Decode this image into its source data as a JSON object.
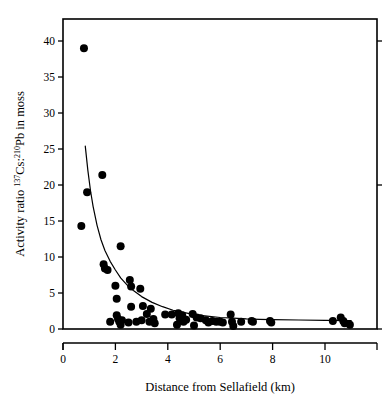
{
  "chart_data": {
    "type": "scatter",
    "title": "",
    "xlabel": "Distance from Sellafield (km)",
    "ylabel_parts": {
      "lead": "Activity ratio ",
      "sup1": "137",
      "mid1": "Cs:",
      "sup2": "210",
      "mid2": "Pb in moss"
    },
    "ylabel": "Activity ratio 137Cs:210Pb in moss",
    "xlim": [
      0,
      12.0
    ],
    "ylim": [
      -1.5,
      42.5
    ],
    "xticks": [
      0,
      2,
      4,
      6,
      8,
      10
    ],
    "xticklabels": [
      "0",
      "2",
      "4",
      "6",
      "8",
      "10"
    ],
    "yticks": [
      0,
      5,
      10,
      15,
      20,
      25,
      30,
      35,
      40
    ],
    "yticklabels": [
      "0",
      "5",
      "10",
      "15",
      "20",
      "25",
      "30",
      "35",
      "40"
    ],
    "grid": false,
    "legend": null,
    "frame": "box",
    "marker": {
      "shape": "circle",
      "color": "#000000",
      "size": 4.0
    },
    "fit_curve": {
      "style": "solid",
      "color": "#000000",
      "width": 1.2,
      "description": "decaying power-law / exponential fit through the scatter",
      "points": [
        [
          0.85,
          25.4
        ],
        [
          0.95,
          22.0
        ],
        [
          1.05,
          19.2
        ],
        [
          1.15,
          17.0
        ],
        [
          1.3,
          14.4
        ],
        [
          1.45,
          12.4
        ],
        [
          1.6,
          10.9
        ],
        [
          1.8,
          9.4
        ],
        [
          2.0,
          8.2
        ],
        [
          2.2,
          7.1
        ],
        [
          2.45,
          6.1
        ],
        [
          2.7,
          5.3
        ],
        [
          3.0,
          4.5
        ],
        [
          3.4,
          3.7
        ],
        [
          3.8,
          3.1
        ],
        [
          4.2,
          2.6
        ],
        [
          4.6,
          2.3
        ],
        [
          5.0,
          2.0
        ],
        [
          5.5,
          1.8
        ],
        [
          6.0,
          1.6
        ],
        [
          6.5,
          1.5
        ],
        [
          7.0,
          1.4
        ],
        [
          7.5,
          1.35
        ],
        [
          8.0,
          1.3
        ],
        [
          9.0,
          1.25
        ],
        [
          10.0,
          1.2
        ],
        [
          11.0,
          1.15
        ]
      ]
    },
    "points": [
      [
        0.8,
        39.0
      ],
      [
        1.5,
        21.4
      ],
      [
        0.92,
        19.0
      ],
      [
        0.7,
        14.3
      ],
      [
        2.2,
        11.5
      ],
      [
        1.55,
        9.0
      ],
      [
        1.6,
        8.4
      ],
      [
        1.7,
        8.2
      ],
      [
        2.55,
        6.8
      ],
      [
        2.0,
        6.0
      ],
      [
        2.6,
        5.9
      ],
      [
        2.95,
        5.6
      ],
      [
        2.05,
        4.2
      ],
      [
        2.6,
        3.1
      ],
      [
        3.05,
        3.2
      ],
      [
        3.35,
        2.8
      ],
      [
        1.8,
        1.0
      ],
      [
        2.05,
        1.9
      ],
      [
        2.1,
        1.4
      ],
      [
        2.15,
        1.0
      ],
      [
        2.2,
        0.6
      ],
      [
        2.25,
        1.2
      ],
      [
        2.5,
        0.9
      ],
      [
        2.8,
        1.0
      ],
      [
        3.0,
        1.2
      ],
      [
        3.2,
        2.1
      ],
      [
        3.3,
        1.0
      ],
      [
        3.45,
        1.4
      ],
      [
        3.5,
        0.8
      ],
      [
        3.9,
        2.0
      ],
      [
        4.15,
        2.0
      ],
      [
        4.35,
        0.6
      ],
      [
        4.4,
        2.2
      ],
      [
        4.45,
        1.5
      ],
      [
        4.55,
        1.9
      ],
      [
        4.6,
        1.0
      ],
      [
        4.7,
        1.3
      ],
      [
        4.95,
        2.1
      ],
      [
        5.0,
        0.5
      ],
      [
        5.1,
        1.6
      ],
      [
        5.25,
        1.5
      ],
      [
        5.45,
        1.2
      ],
      [
        5.55,
        0.9
      ],
      [
        5.7,
        1.1
      ],
      [
        5.85,
        1.0
      ],
      [
        6.0,
        1.0
      ],
      [
        6.1,
        0.9
      ],
      [
        6.4,
        2.0
      ],
      [
        6.45,
        1.0
      ],
      [
        6.5,
        0.4
      ],
      [
        6.8,
        1.0
      ],
      [
        7.2,
        1.1
      ],
      [
        7.25,
        1.0
      ],
      [
        7.9,
        1.1
      ],
      [
        7.95,
        0.9
      ],
      [
        10.3,
        1.1
      ],
      [
        10.6,
        1.6
      ],
      [
        10.7,
        1.1
      ],
      [
        10.75,
        0.8
      ],
      [
        10.95,
        0.6
      ]
    ]
  }
}
